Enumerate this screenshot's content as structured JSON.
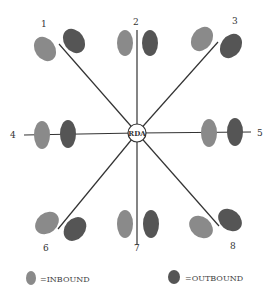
{
  "diagram": {
    "center_label": "RDA",
    "colors": {
      "inbound": "#8a8a8a",
      "outbound": "#555555",
      "line": "#333333"
    },
    "nodes": [
      {
        "id": "1",
        "label": "1"
      },
      {
        "id": "2",
        "label": "2"
      },
      {
        "id": "3",
        "label": "3"
      },
      {
        "id": "4",
        "label": "4"
      },
      {
        "id": "5",
        "label": "5"
      },
      {
        "id": "6",
        "label": "6"
      },
      {
        "id": "7",
        "label": "7"
      },
      {
        "id": "8",
        "label": "8"
      }
    ]
  },
  "legend": {
    "inbound_label": "=INBOUND",
    "outbound_label": "=OUTBOUND"
  }
}
